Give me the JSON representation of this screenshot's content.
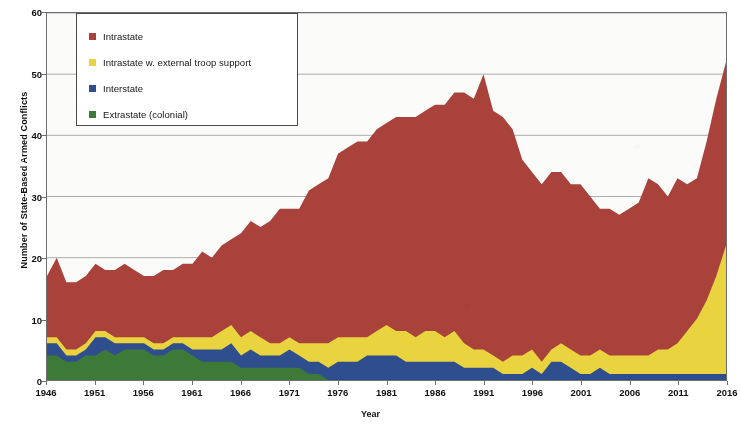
{
  "chart_data": {
    "type": "area",
    "stacked": true,
    "title": "",
    "xlabel": "Year",
    "ylabel": "Number of State-Based Armed Conflicts",
    "ylim": [
      0,
      60
    ],
    "ytick_step": 10,
    "yticks": [
      0,
      10,
      20,
      30,
      40,
      50,
      60
    ],
    "xlim": [
      1946,
      2016
    ],
    "xtick_step": 5,
    "xticks": [
      1946,
      1951,
      1956,
      1961,
      1966,
      1971,
      1976,
      1981,
      1986,
      1991,
      1996,
      2001,
      2006,
      2011,
      2016
    ],
    "grid": "horizontal",
    "legend_position": "top-left",
    "colors": {
      "intrastate": "#A8423B",
      "intrastate_external": "#E9D33F",
      "interstate": "#2E4E8E",
      "extrastate": "#3E7A37"
    },
    "x": [
      1946,
      1947,
      1948,
      1949,
      1950,
      1951,
      1952,
      1953,
      1954,
      1955,
      1956,
      1957,
      1958,
      1959,
      1960,
      1961,
      1962,
      1963,
      1964,
      1965,
      1966,
      1967,
      1968,
      1969,
      1970,
      1971,
      1972,
      1973,
      1974,
      1975,
      1976,
      1977,
      1978,
      1979,
      1980,
      1981,
      1982,
      1983,
      1984,
      1985,
      1986,
      1987,
      1988,
      1989,
      1990,
      1991,
      1992,
      1993,
      1994,
      1995,
      1996,
      1997,
      1998,
      1999,
      2000,
      2001,
      2002,
      2003,
      2004,
      2005,
      2006,
      2007,
      2008,
      2009,
      2010,
      2011,
      2012,
      2013,
      2014,
      2015,
      2016
    ],
    "series": [
      {
        "name": "Extrastate (colonial)",
        "key": "extrastate",
        "values": [
          4,
          4,
          3,
          3,
          4,
          4,
          5,
          4,
          5,
          5,
          5,
          4,
          4,
          5,
          5,
          4,
          3,
          3,
          3,
          3,
          2,
          2,
          2,
          2,
          2,
          2,
          2,
          1,
          1,
          0,
          0,
          0,
          0,
          0,
          0,
          0,
          0,
          0,
          0,
          0,
          0,
          0,
          0,
          0,
          0,
          0,
          0,
          0,
          0,
          0,
          0,
          0,
          0,
          0,
          0,
          0,
          0,
          0,
          0,
          0,
          0,
          0,
          0,
          0,
          0,
          0,
          0,
          0,
          0,
          0,
          0
        ]
      },
      {
        "name": "Interstate",
        "key": "interstate",
        "values": [
          2,
          2,
          1,
          1,
          1,
          3,
          2,
          2,
          1,
          1,
          1,
          1,
          1,
          1,
          1,
          1,
          2,
          2,
          2,
          3,
          2,
          3,
          2,
          2,
          2,
          3,
          2,
          2,
          2,
          2,
          3,
          3,
          3,
          4,
          4,
          4,
          4,
          3,
          3,
          3,
          3,
          3,
          3,
          2,
          2,
          2,
          2,
          1,
          1,
          1,
          2,
          1,
          3,
          3,
          2,
          1,
          1,
          2,
          1,
          1,
          1,
          1,
          1,
          1,
          1,
          1,
          1,
          1,
          1,
          1,
          1
        ]
      },
      {
        "name": "Intrastate w. external troop support",
        "key": "intrastate_external",
        "values": [
          1,
          1,
          1,
          1,
          1,
          1,
          1,
          1,
          1,
          1,
          1,
          1,
          1,
          1,
          1,
          2,
          2,
          2,
          3,
          3,
          3,
          3,
          3,
          2,
          2,
          2,
          2,
          3,
          3,
          4,
          4,
          4,
          4,
          3,
          4,
          5,
          4,
          5,
          4,
          5,
          5,
          4,
          5,
          4,
          3,
          3,
          2,
          2,
          3,
          3,
          3,
          2,
          2,
          3,
          3,
          3,
          3,
          3,
          3,
          3,
          3,
          3,
          3,
          4,
          4,
          5,
          7,
          9,
          12,
          16,
          21
        ]
      },
      {
        "name": "Intrastate",
        "key": "intrastate",
        "values": [
          10,
          13,
          11,
          11,
          11,
          11,
          10,
          11,
          12,
          11,
          10,
          11,
          12,
          11,
          12,
          12,
          14,
          13,
          14,
          14,
          17,
          18,
          18,
          20,
          22,
          21,
          22,
          25,
          26,
          27,
          30,
          31,
          32,
          32,
          33,
          33,
          35,
          35,
          36,
          36,
          37,
          38,
          39,
          41,
          41,
          45,
          40,
          40,
          37,
          32,
          29,
          29,
          29,
          28,
          27,
          28,
          26,
          23,
          24,
          23,
          24,
          25,
          29,
          27,
          25,
          27,
          24,
          23,
          26,
          29,
          30
        ]
      }
    ]
  },
  "legend": {
    "items": [
      {
        "label": "Intrastate",
        "color": "#A8423B",
        "swatch_name": "legend-swatch-intrastate"
      },
      {
        "label": "Intrastate w. external troop support",
        "color": "#E9D33F",
        "swatch_name": "legend-swatch-intrastate-external"
      },
      {
        "label": "Interstate",
        "color": "#2E4E8E",
        "swatch_name": "legend-swatch-interstate"
      },
      {
        "label": "Extrastate (colonial)",
        "color": "#3E7A37",
        "swatch_name": "legend-swatch-extrastate"
      }
    ]
  },
  "axes": {
    "y_title": "Number of State-Based Armed Conflicts",
    "x_title": "Year",
    "y_labels": [
      "60",
      "50",
      "40",
      "30",
      "20",
      "10",
      "0"
    ],
    "x_labels": [
      "1946",
      "1951",
      "1956",
      "1961",
      "1966",
      "1971",
      "1976",
      "1981",
      "1986",
      "1991",
      "1996",
      "2001",
      "2006",
      "2011",
      "2016"
    ]
  }
}
